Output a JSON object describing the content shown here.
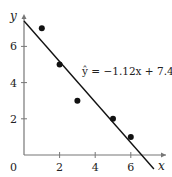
{
  "chart_data": {
    "type": "scatter",
    "title": "",
    "xlabel": "x",
    "ylabel": "y",
    "origin_label": "0",
    "x_ticks": [
      2,
      4,
      6
    ],
    "y_ticks": [
      2,
      4,
      6
    ],
    "xlim": [
      0,
      7.6
    ],
    "ylim": [
      0,
      7.7
    ],
    "grid": false,
    "points": [
      {
        "x": 1,
        "y": 7
      },
      {
        "x": 2,
        "y": 5
      },
      {
        "x": 3,
        "y": 3
      },
      {
        "x": 5,
        "y": 2
      },
      {
        "x": 6,
        "y": 1
      }
    ],
    "regression": {
      "slope": -1.12,
      "intercept": 7.4,
      "x_range": [
        0,
        7.3
      ],
      "label": "ŷ = −1.12x + 7.40"
    },
    "colors": {
      "axis": "#777777",
      "line": "#111111",
      "points": "#111111"
    }
  }
}
